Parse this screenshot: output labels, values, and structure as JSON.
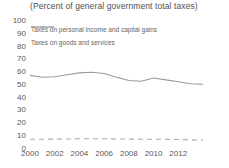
{
  "colors": {
    "background": "#ffffff",
    "text": "#595959",
    "title_text": "#4f4f4f",
    "series_dashed": "#ababab",
    "series_solid": "#999999"
  },
  "chart_data": {
    "type": "line",
    "title": "(Percent of general government total taxes)",
    "x": [
      2000,
      2001,
      2002,
      2003,
      2004,
      2005,
      2006,
      2007,
      2008,
      2009,
      2010,
      2011,
      2012,
      2013,
      2014
    ],
    "x_tick_labels": [
      "2000",
      "2002",
      "2004",
      "2006",
      "2008",
      "2010",
      "2012"
    ],
    "x_tick_years": [
      2000,
      2002,
      2004,
      2006,
      2008,
      2010,
      2012
    ],
    "y_ticks": [
      0,
      10,
      20,
      30,
      40,
      50,
      60,
      70,
      80,
      90,
      100
    ],
    "ylim": [
      0,
      100
    ],
    "xlim": [
      2000,
      2015.7
    ],
    "grid": false,
    "axis_lines": false,
    "legend_position": "top-left",
    "series": [
      {
        "name": "Taxes on personal income and capital gains",
        "line_style": "dashed",
        "color": "#ababab",
        "values": [
          6.8,
          6.9,
          7.0,
          7.1,
          7.2,
          7.2,
          7.2,
          7.1,
          7.0,
          6.9,
          6.9,
          6.8,
          6.7,
          6.4,
          6.2
        ]
      },
      {
        "name": "Taxes on goods and services",
        "line_style": "solid",
        "color": "#999999",
        "values": [
          57,
          55.5,
          56,
          57.5,
          59,
          59.5,
          58.5,
          55.5,
          53,
          52.5,
          55,
          53.5,
          52,
          50.5,
          50
        ]
      }
    ]
  }
}
